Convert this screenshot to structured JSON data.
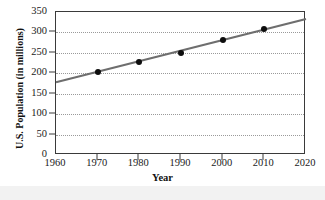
{
  "chart_data": {
    "type": "scatter",
    "title": "",
    "xlabel": "Year",
    "ylabel": "U.S. Population (in millions)",
    "xlim": [
      1960,
      2020
    ],
    "ylim": [
      0,
      350
    ],
    "xticks": [
      1960,
      1970,
      1980,
      1990,
      2000,
      2010,
      2020
    ],
    "yticks": [
      0,
      50,
      100,
      150,
      200,
      250,
      300,
      350
    ],
    "grid": "horizontal-dotted",
    "legend": "none",
    "x": [
      1970,
      1980,
      1990,
      2000,
      2010
    ],
    "values": [
      203,
      227,
      249,
      281,
      309
    ],
    "points": [
      {
        "year": 1970,
        "population": 203
      },
      {
        "year": 1980,
        "population": 227
      },
      {
        "year": 1990,
        "population": 249
      },
      {
        "year": 2000,
        "population": 281
      },
      {
        "year": 2010,
        "population": 309
      }
    ],
    "trend_line": {
      "x_start": 1960,
      "y_start": 178,
      "x_end": 2020,
      "y_end": 333,
      "color": "#6e6e6e"
    },
    "colors": {
      "point": "#0d0d0d",
      "line": "#6e6e6e",
      "axis": "#3a3a3a",
      "grid": "#9a9a9a",
      "plot_background": "#ffffff",
      "figure_background": "#ffffff"
    }
  }
}
